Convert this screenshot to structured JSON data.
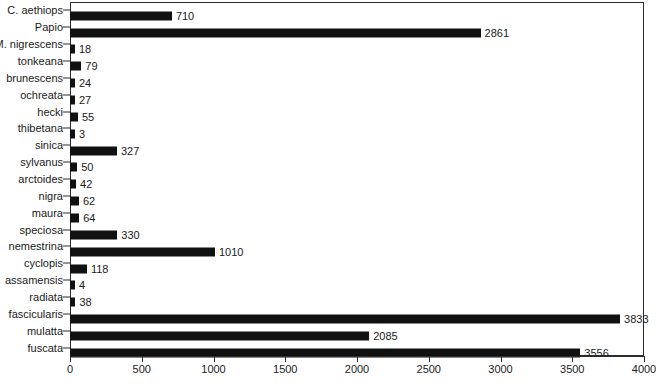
{
  "chart_data": {
    "type": "bar",
    "orientation": "horizontal",
    "title": "",
    "xlabel": "",
    "ylabel": "",
    "xlim": [
      0,
      4000
    ],
    "xticks": [
      0,
      500,
      1000,
      1500,
      2000,
      2500,
      3000,
      3500,
      4000
    ],
    "xtick_labels": [
      "0",
      "500",
      "1000",
      "1500",
      "2000",
      "2500",
      "3000",
      "3500",
      "4000"
    ],
    "grid": false,
    "legend": null,
    "bar_color": "#111111",
    "axis_color": "#2b2b2b",
    "show_value_labels": true,
    "categories": [
      "C. aethiops",
      "Papio",
      "M. nigrescens",
      "tonkeana",
      "brunescens",
      "ochreata",
      "hecki",
      "thibetana",
      "sinica",
      "sylvanus",
      "arctoides",
      "nigra",
      "maura",
      "speciosa",
      "nemestrina",
      "cyclopis",
      "assamensis",
      "radiata",
      "fascicularis",
      "mulatta",
      "fuscata"
    ],
    "values": [
      710,
      2861,
      18,
      79,
      24,
      27,
      55,
      3,
      327,
      50,
      42,
      62,
      64,
      330,
      1010,
      118,
      4,
      38,
      3833,
      2085,
      3556
    ],
    "value_labels": [
      "710",
      "2861",
      "18",
      "79",
      "24",
      "27",
      "55",
      "3",
      "327",
      "50",
      "42",
      "62",
      "64",
      "330",
      "1010",
      "118",
      "4",
      "38",
      "3833",
      "2085",
      "3556"
    ]
  }
}
